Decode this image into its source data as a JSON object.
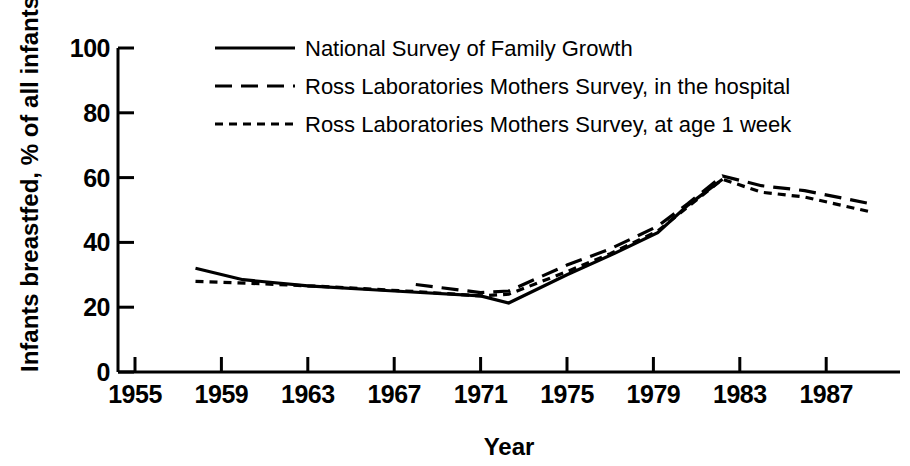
{
  "chart_data": {
    "type": "line",
    "title": "",
    "xlabel": "Year",
    "ylabel": "Infants breastfed, % of all infants",
    "xlim": [
      1955,
      1990
    ],
    "ylim": [
      0,
      100
    ],
    "grid": false,
    "legend_position": "top-center",
    "x_ticks": [
      "1955",
      "1959",
      "1963",
      "1967",
      "1971",
      "1975",
      "1979",
      "1983",
      "1987"
    ],
    "x_tick_values": [
      1955,
      1959,
      1963,
      1967,
      1971,
      1975,
      1979,
      1983,
      1987
    ],
    "y_ticks": [
      "0",
      "20",
      "40",
      "60",
      "80",
      "100"
    ],
    "y_tick_values": [
      0,
      20,
      40,
      60,
      80,
      100
    ],
    "series": [
      {
        "name": "National Survey of Family Growth",
        "style": "solid",
        "points": [
          {
            "x": 1957.8,
            "y": 32.0
          },
          {
            "x": 1960.0,
            "y": 28.5
          },
          {
            "x": 1963.0,
            "y": 26.6
          },
          {
            "x": 1967.0,
            "y": 25.0
          },
          {
            "x": 1971.0,
            "y": 23.5
          },
          {
            "x": 1972.3,
            "y": 21.3
          },
          {
            "x": 1975.0,
            "y": 30.0
          },
          {
            "x": 1977.0,
            "y": 36.0
          },
          {
            "x": 1979.2,
            "y": 43.0
          },
          {
            "x": 1980.6,
            "y": 51.5
          },
          {
            "x": 1982.2,
            "y": 59.5
          }
        ]
      },
      {
        "name": "Ross Laboratories Mothers Survey, in the hospital",
        "style": "dashed",
        "points": [
          {
            "x": 1968.0,
            "y": 27.0
          },
          {
            "x": 1971.0,
            "y": 24.5
          },
          {
            "x": 1972.3,
            "y": 25.0
          },
          {
            "x": 1975.0,
            "y": 33.0
          },
          {
            "x": 1977.0,
            "y": 38.0
          },
          {
            "x": 1979.2,
            "y": 45.0
          },
          {
            "x": 1980.6,
            "y": 52.0
          },
          {
            "x": 1982.2,
            "y": 60.5
          },
          {
            "x": 1984.0,
            "y": 57.5
          },
          {
            "x": 1986.0,
            "y": 56.0
          },
          {
            "x": 1989.0,
            "y": 52.0
          }
        ]
      },
      {
        "name": "Ross Laboratories Mothers Survey, at age 1 week",
        "style": "dotted",
        "points": [
          {
            "x": 1957.8,
            "y": 28.0
          },
          {
            "x": 1961.0,
            "y": 27.2
          },
          {
            "x": 1964.0,
            "y": 26.3
          },
          {
            "x": 1968.0,
            "y": 24.8
          },
          {
            "x": 1971.0,
            "y": 23.5
          },
          {
            "x": 1972.3,
            "y": 24.0
          },
          {
            "x": 1975.0,
            "y": 31.0
          },
          {
            "x": 1977.0,
            "y": 36.5
          },
          {
            "x": 1979.2,
            "y": 43.5
          },
          {
            "x": 1980.6,
            "y": 51.0
          },
          {
            "x": 1982.2,
            "y": 59.5
          },
          {
            "x": 1984.0,
            "y": 55.5
          },
          {
            "x": 1986.0,
            "y": 54.0
          },
          {
            "x": 1989.0,
            "y": 49.5
          }
        ]
      }
    ],
    "legend": [
      {
        "label": "National Survey of Family Growth",
        "style": "solid"
      },
      {
        "label": "Ross Laboratories Mothers Survey, in the hospital",
        "style": "dashed"
      },
      {
        "label": "Ross Laboratories Mothers Survey, at age 1 week",
        "style": "dotted"
      }
    ],
    "colors": {
      "line": "#000000",
      "axis": "#000000",
      "background": "#ffffff"
    }
  }
}
